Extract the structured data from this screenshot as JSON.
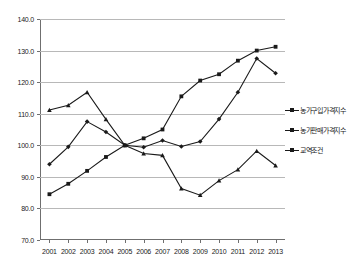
{
  "chart_data": {
    "type": "line",
    "title": "",
    "subtitle": "",
    "xlabel": "",
    "ylabel": "",
    "categories": [
      "2001",
      "2002",
      "2003",
      "2004",
      "2005",
      "2006",
      "2007",
      "2008",
      "2009",
      "2010",
      "2011",
      "2012",
      "2013"
    ],
    "ylim": [
      70.0,
      140.0
    ],
    "ytick_labels": [
      "140.0",
      "130.0",
      "120.0",
      "110.0",
      "100.0",
      "90.0",
      "80.0",
      "70.0"
    ],
    "ytick_values": [
      140.0,
      130.0,
      120.0,
      110.0,
      100.0,
      90.0,
      80.0,
      70.0
    ],
    "grid": "horizontal",
    "legend_position": "right",
    "series": [
      {
        "name": "농가구입가격지수",
        "color": "#1a1a1a",
        "marker": "square",
        "values": [
          84.5,
          87.8,
          91.9,
          96.3,
          100.0,
          102.2,
          105.0,
          115.5,
          120.5,
          122.5,
          126.8,
          130.0,
          131.2
        ]
      },
      {
        "name": "농가판매가격지수",
        "color": "#1a1a1a",
        "marker": "diamond",
        "values": [
          94.0,
          99.5,
          107.5,
          104.2,
          100.0,
          99.4,
          101.5,
          99.6,
          101.2,
          108.3,
          116.8,
          127.5,
          122.8
        ]
      },
      {
        "name": "교역조건",
        "color": "#1a1a1a",
        "marker": "triangle",
        "values": [
          111.2,
          112.7,
          116.8,
          108.2,
          100.0,
          97.4,
          96.8,
          86.3,
          84.2,
          88.8,
          92.3,
          98.2,
          93.6
        ]
      }
    ]
  },
  "legend": {
    "items": [
      {
        "label": "농가구입가격지수"
      },
      {
        "label": "농가판매가격지수"
      },
      {
        "label": "교역조건"
      }
    ]
  }
}
